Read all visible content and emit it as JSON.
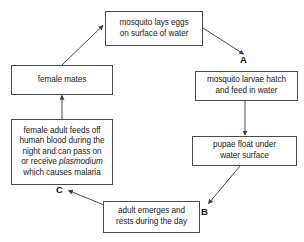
{
  "diagram": {
    "stroke_color": "#4a4a4a",
    "text_color": "#1a1a1a",
    "background_color": "#ffffff",
    "nodes": [
      {
        "id": "lays-eggs",
        "label": "mosquito lays eggs\non surface of water",
        "x": 105,
        "y": 11,
        "w": 98,
        "h": 35
      },
      {
        "id": "larvae-hatch",
        "label": "mosquito larvae hatch\nand feed in water",
        "x": 195,
        "y": 71,
        "w": 103,
        "h": 30
      },
      {
        "id": "pupae-float",
        "label": "pupae float under\nwater surface",
        "x": 192,
        "y": 136,
        "w": 105,
        "h": 30
      },
      {
        "id": "adult-emerges",
        "label": "adult emerges and\nrests during the day",
        "x": 103,
        "y": 201,
        "w": 97,
        "h": 32
      },
      {
        "id": "female-adult-feeds",
        "label": "female adult feeds off\nhuman blood during the\nnight and can pass on\nor receive plasmodium\nwhich causes malaria",
        "label_italic_word": "plasmodium",
        "x": 11,
        "y": 119,
        "w": 102,
        "h": 66
      },
      {
        "id": "female-mates",
        "label": "female mates",
        "x": 11,
        "y": 65,
        "w": 102,
        "h": 30
      }
    ],
    "step_labels": [
      {
        "id": "label-a",
        "text": "A",
        "x": 240,
        "y": 55
      },
      {
        "id": "label-b",
        "text": "B",
        "x": 201,
        "y": 207
      },
      {
        "id": "label-c",
        "text": "C",
        "x": 56,
        "y": 185
      }
    ],
    "edges": [
      {
        "id": "eggs-to-larvae",
        "from": "lays-eggs",
        "to": "larvae-hatch",
        "kind": "diagonal"
      },
      {
        "id": "larvae-to-pupae",
        "from": "larvae-hatch",
        "to": "pupae-float",
        "kind": "vertical"
      },
      {
        "id": "pupae-to-adult",
        "from": "pupae-float",
        "to": "adult-emerges",
        "kind": "diagonal"
      },
      {
        "id": "adult-to-female-feeds",
        "from": "adult-emerges",
        "to": "female-adult-feeds",
        "kind": "diagonal"
      },
      {
        "id": "female-feeds-to-mates",
        "from": "female-adult-feeds",
        "to": "female-mates",
        "kind": "vertical"
      },
      {
        "id": "mates-to-eggs",
        "from": "female-mates",
        "to": "lays-eggs",
        "kind": "diagonal"
      }
    ]
  }
}
